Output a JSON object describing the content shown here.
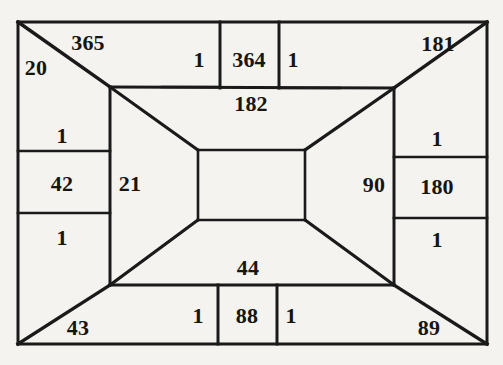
{
  "figure": {
    "kind": "geometric-diagram",
    "background_color": "#f4f3f0",
    "line_color": "#1a1a1a",
    "text_color": "#17150f",
    "outer_rect": {
      "x": 18,
      "y": 22,
      "width": 469,
      "height": 322
    },
    "inner_trapezoid_frame": {
      "x": 110,
      "y": 87,
      "width": 284,
      "height": 198
    },
    "center_rect": {
      "x": 198,
      "y": 150,
      "width": 107,
      "height": 70
    },
    "labels": [
      {
        "name": "label-365",
        "text": "365",
        "x": 88,
        "y": 43,
        "size": "big"
      },
      {
        "name": "label-20",
        "text": "20",
        "x": 36,
        "y": 68,
        "size": "big"
      },
      {
        "name": "label-top-left-one",
        "text": "1",
        "x": 199,
        "y": 60,
        "size": "big"
      },
      {
        "name": "label-364",
        "text": "364",
        "x": 249,
        "y": 60,
        "size": "big"
      },
      {
        "name": "label-top-right-one",
        "text": "1",
        "x": 293,
        "y": 60,
        "size": "big"
      },
      {
        "name": "label-181",
        "text": "181",
        "x": 438,
        "y": 44,
        "size": "big"
      },
      {
        "name": "label-182",
        "text": "182",
        "x": 251,
        "y": 104,
        "size": "big"
      },
      {
        "name": "label-left-upper-one",
        "text": "1",
        "x": 62,
        "y": 136,
        "size": "big"
      },
      {
        "name": "label-42",
        "text": "42",
        "x": 62,
        "y": 184,
        "size": "big"
      },
      {
        "name": "label-left-lower-one",
        "text": "1",
        "x": 62,
        "y": 238,
        "size": "big"
      },
      {
        "name": "label-21",
        "text": "21",
        "x": 130,
        "y": 184,
        "size": "big"
      },
      {
        "name": "label-90",
        "text": "90",
        "x": 374,
        "y": 185,
        "size": "big"
      },
      {
        "name": "label-right-upper-one",
        "text": "1",
        "x": 437,
        "y": 139,
        "size": "big"
      },
      {
        "name": "label-180",
        "text": "180",
        "x": 437,
        "y": 187,
        "size": "big"
      },
      {
        "name": "label-right-lower-one",
        "text": "1",
        "x": 437,
        "y": 240,
        "size": "big"
      },
      {
        "name": "label-44",
        "text": "44",
        "x": 248,
        "y": 268,
        "size": "big"
      },
      {
        "name": "label-bottom-left-one",
        "text": "1",
        "x": 198,
        "y": 316,
        "size": "big"
      },
      {
        "name": "label-88",
        "text": "88",
        "x": 247,
        "y": 316,
        "size": "big"
      },
      {
        "name": "label-bottom-right-one",
        "text": "1",
        "x": 291,
        "y": 316,
        "size": "big"
      },
      {
        "name": "label-43",
        "text": "43",
        "x": 78,
        "y": 328,
        "size": "big"
      },
      {
        "name": "label-89",
        "text": "89",
        "x": 429,
        "y": 328,
        "size": "big"
      }
    ],
    "segments": [
      {
        "name": "outer-rect-top",
        "x1": 18,
        "y1": 22,
        "x2": 487,
        "y2": 22,
        "w": 3
      },
      {
        "name": "outer-rect-right",
        "x1": 487,
        "y1": 22,
        "x2": 487,
        "y2": 344,
        "w": 3
      },
      {
        "name": "outer-rect-bottom",
        "x1": 487,
        "y1": 344,
        "x2": 18,
        "y2": 344,
        "w": 3
      },
      {
        "name": "outer-rect-left",
        "x1": 18,
        "y1": 344,
        "x2": 18,
        "y2": 22,
        "w": 3
      },
      {
        "name": "diagonal-top-left",
        "x1": 18,
        "y1": 22,
        "x2": 110,
        "y2": 87,
        "w": 3.4
      },
      {
        "name": "diagonal-top-right",
        "x1": 487,
        "y1": 22,
        "x2": 394,
        "y2": 88,
        "w": 3.4
      },
      {
        "name": "diagonal-bottom-left",
        "x1": 18,
        "y1": 344,
        "x2": 110,
        "y2": 285,
        "w": 3.4
      },
      {
        "name": "diagonal-bottom-right",
        "x1": 487,
        "y1": 344,
        "x2": 394,
        "y2": 285,
        "w": 3.4
      },
      {
        "name": "frame-top",
        "x1": 110,
        "y1": 87,
        "x2": 394,
        "y2": 88,
        "w": 3
      },
      {
        "name": "frame-left",
        "x1": 110,
        "y1": 87,
        "x2": 110,
        "y2": 285,
        "w": 3
      },
      {
        "name": "frame-right",
        "x1": 394,
        "y1": 88,
        "x2": 394,
        "y2": 285,
        "w": 3
      },
      {
        "name": "frame-bottom",
        "x1": 110,
        "y1": 285,
        "x2": 394,
        "y2": 285,
        "w": 3
      },
      {
        "name": "center-rect-top",
        "x1": 198,
        "y1": 150,
        "x2": 305,
        "y2": 150,
        "w": 2.6
      },
      {
        "name": "center-rect-right",
        "x1": 305,
        "y1": 150,
        "x2": 305,
        "y2": 220,
        "w": 2.6
      },
      {
        "name": "center-rect-bottom",
        "x1": 305,
        "y1": 220,
        "x2": 198,
        "y2": 220,
        "w": 2.6
      },
      {
        "name": "center-rect-left",
        "x1": 198,
        "y1": 220,
        "x2": 198,
        "y2": 150,
        "w": 2.6
      },
      {
        "name": "perspective-top-left",
        "x1": 110,
        "y1": 87,
        "x2": 198,
        "y2": 150,
        "w": 3.2
      },
      {
        "name": "perspective-top-right",
        "x1": 394,
        "y1": 88,
        "x2": 305,
        "y2": 150,
        "w": 3.2
      },
      {
        "name": "perspective-bottom-left",
        "x1": 110,
        "y1": 285,
        "x2": 198,
        "y2": 220,
        "w": 3.2
      },
      {
        "name": "perspective-bottom-right",
        "x1": 394,
        "y1": 285,
        "x2": 305,
        "y2": 220,
        "w": 3.2
      },
      {
        "name": "top-cell-divider-left",
        "x1": 220,
        "y1": 22,
        "x2": 220,
        "y2": 88,
        "w": 3
      },
      {
        "name": "top-cell-divider-right",
        "x1": 279,
        "y1": 22,
        "x2": 279,
        "y2": 88,
        "w": 3
      },
      {
        "name": "top-strip-baseline-left",
        "x1": 162,
        "y1": 87,
        "x2": 220,
        "y2": 87,
        "w": 2.6
      },
      {
        "name": "top-strip-baseline-right",
        "x1": 279,
        "y1": 88,
        "x2": 340,
        "y2": 88,
        "w": 2.6
      },
      {
        "name": "bottom-cell-divider-left",
        "x1": 218,
        "y1": 285,
        "x2": 218,
        "y2": 344,
        "w": 3
      },
      {
        "name": "bottom-cell-divider-right",
        "x1": 277,
        "y1": 285,
        "x2": 277,
        "y2": 344,
        "w": 3
      },
      {
        "name": "left-column-divider",
        "x1": 18,
        "y1": 151,
        "x2": 110,
        "y2": 151,
        "w": 2.6
      },
      {
        "name": "left-column-divider-2",
        "x1": 18,
        "y1": 213,
        "x2": 110,
        "y2": 213,
        "w": 2.6
      },
      {
        "name": "right-column-divider",
        "x1": 394,
        "y1": 157,
        "x2": 487,
        "y2": 157,
        "w": 2.6
      },
      {
        "name": "right-column-divider-2",
        "x1": 394,
        "y1": 218,
        "x2": 487,
        "y2": 218,
        "w": 2.6
      }
    ]
  }
}
